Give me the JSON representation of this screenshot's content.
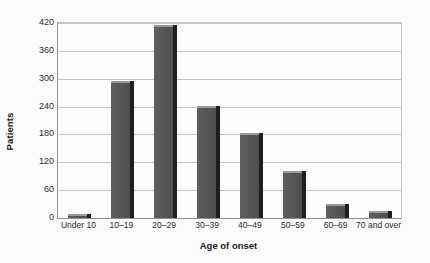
{
  "chart_data": {
    "type": "bar",
    "title": "",
    "xlabel": "Age of onset",
    "ylabel": "Patients",
    "categories": [
      "Under 10",
      "10–19",
      "20–29",
      "30–39",
      "40–49",
      "50–59",
      "60–69",
      "70 and over"
    ],
    "values": [
      5,
      291,
      411,
      237,
      179,
      97,
      26,
      11
    ],
    "ylim": [
      0,
      420
    ],
    "yticks": [
      0,
      60,
      120,
      180,
      240,
      300,
      360,
      420
    ],
    "ytick_labels": [
      "0",
      "60",
      "120",
      "180",
      "240",
      "300",
      "360",
      "420"
    ],
    "grid": true,
    "legend": false,
    "bar_color": "#585858",
    "bar_edge_color": "#1f1f1f",
    "gridline_color": "#c2c2c2",
    "axis_color": "#8f8f8f",
    "background_color": "#fbfbfb"
  }
}
